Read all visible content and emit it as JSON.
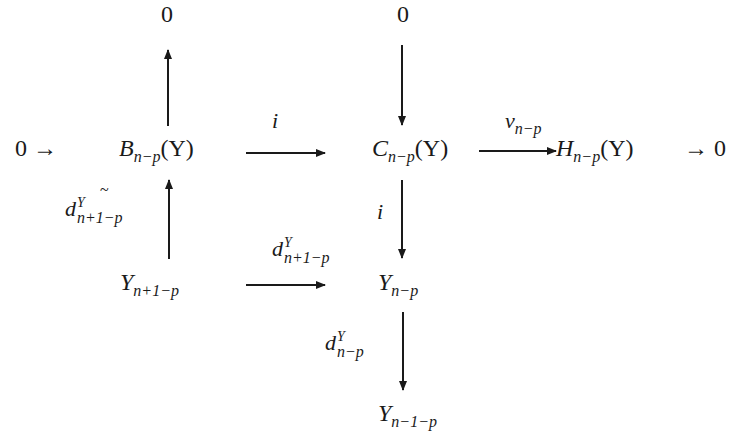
{
  "diagram": {
    "type": "commutative-diagram",
    "nodes": {
      "zero_top_left": "0",
      "zero_top_right": "0",
      "zero_left": "0",
      "arrow_left": "→",
      "B": {
        "base": "B",
        "sub": "n−p",
        "arg": "(Y)"
      },
      "C": {
        "base": "C",
        "sub": "n−p",
        "arg": "(Y)"
      },
      "H": {
        "base": "H",
        "sub": "n−p",
        "arg": "(Y)"
      },
      "arrow_right": "→",
      "zero_right": "0",
      "Y_n1p": {
        "base": "Y",
        "sub": "n+1−p"
      },
      "Y_np": {
        "base": "Y",
        "sub": "n−p"
      },
      "Y_n_1p": {
        "base": "Y",
        "sub": "n−1−p"
      }
    },
    "labels": {
      "B_to_C": "i",
      "C_to_H": {
        "base": "ν",
        "sub": "n−p"
      },
      "Y_to_B": {
        "base": "d",
        "sup": "Y",
        "sub": "n+1−p",
        "accent": "~"
      },
      "Y_to_Ynp": {
        "base": "d",
        "sup": "Y",
        "sub": "n+1−p"
      },
      "C_to_Ynp": "i",
      "Ynp_to_Yn1p": {
        "base": "d",
        "sup": "Y",
        "sub": "n−p"
      }
    },
    "arrows": [
      {
        "from": "B",
        "to": "zero_top_left",
        "direction": "up"
      },
      {
        "from": "zero_top_right",
        "to": "C",
        "direction": "down"
      },
      {
        "from": "B",
        "to": "C",
        "label": "i",
        "direction": "right"
      },
      {
        "from": "C",
        "to": "H",
        "label": "ν_{n−p}",
        "direction": "right"
      },
      {
        "from": "Y_n1p",
        "to": "B",
        "label": "d^Y_{n+1−p}~",
        "direction": "up"
      },
      {
        "from": "C",
        "to": "Y_np",
        "label": "i",
        "direction": "down"
      },
      {
        "from": "Y_n1p",
        "to": "Y_np",
        "label": "d^Y_{n+1−p}",
        "direction": "right"
      },
      {
        "from": "Y_np",
        "to": "Y_n_1p",
        "label": "d^Y_{n−p}",
        "direction": "down"
      }
    ],
    "colors": {
      "ink": "#1a1a1a",
      "background": "#ffffff"
    }
  }
}
